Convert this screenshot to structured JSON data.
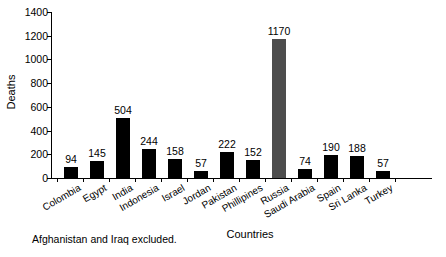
{
  "chart_data": {
    "type": "bar",
    "title": "",
    "xlabel": "Countries",
    "ylabel": "Deaths",
    "ylim": [
      0,
      1400
    ],
    "ytick_step": 200,
    "yticks": [
      "1400",
      "1200",
      "1000",
      "800",
      "600",
      "400",
      "200",
      "0"
    ],
    "grid": false,
    "legend": "none",
    "bar_color": "#000000",
    "highlight_color": "#4d4d4d",
    "highlight_category": "Russia",
    "categories": [
      "Colombia",
      "Egypt",
      "India",
      "Indonesia",
      "Israel",
      "Jordan",
      "Pakistan",
      "Phillipines",
      "Russia",
      "Saudi Arabia",
      "Spain",
      "Sri Lanka",
      "Turkey"
    ],
    "values": [
      94,
      145,
      504,
      244,
      158,
      57,
      222,
      152,
      1170,
      74,
      190,
      188,
      57
    ],
    "value_labels": [
      "94",
      "145",
      "504",
      "244",
      "158",
      "57",
      "222",
      "152",
      "1170",
      "74",
      "190",
      "188",
      "57"
    ],
    "footnote": "Afghanistan and Iraq excluded."
  }
}
